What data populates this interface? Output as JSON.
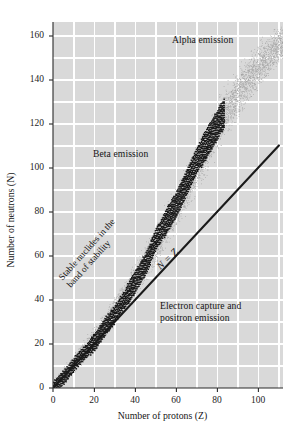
{
  "chart_data": {
    "type": "scatter",
    "title": "",
    "xlabel": "Number of protons (Z)",
    "ylabel": "Number of neutrons (N)",
    "xlim": [
      0,
      112
    ],
    "ylim": [
      0,
      166
    ],
    "xticks": [
      0,
      20,
      40,
      60,
      80,
      100
    ],
    "yticks": [
      0,
      20,
      40,
      60,
      80,
      100,
      120,
      140,
      160
    ],
    "grid": true,
    "grid_minor_step_x": 10,
    "grid_minor_step_y": 10,
    "legend": "none",
    "background_color": "#d9d9d9",
    "grid_color": "#ffffff",
    "series": [
      {
        "name": "Band of stability (stippled)",
        "type": "band",
        "color": "#9a9a9a",
        "description": "Stippled band of known nuclides, widening with Z",
        "x": [
          0,
          10,
          20,
          30,
          40,
          50,
          60,
          70,
          80,
          90,
          100,
          110
        ],
        "y_center": [
          1,
          11,
          22,
          35,
          49,
          65,
          82,
          100,
          119,
          134,
          146,
          156
        ],
        "half_width": [
          2,
          4,
          5,
          6,
          7,
          8,
          9,
          10,
          11,
          11,
          10,
          8
        ]
      },
      {
        "name": "Stable nuclides",
        "type": "staircase",
        "color": "#1a1a1a",
        "x": [
          0,
          5,
          10,
          15,
          20,
          25,
          30,
          35,
          40,
          45,
          50,
          55,
          60,
          65,
          70,
          75,
          80,
          83
        ],
        "y": [
          0,
          5,
          11,
          16,
          21,
          28,
          34,
          41,
          49,
          57,
          68,
          76,
          84,
          94,
          104,
          112,
          120,
          125
        ]
      },
      {
        "name": "N = Z",
        "type": "line",
        "color": "#1a1a1a",
        "x": [
          0,
          110
        ],
        "y": [
          0,
          110
        ]
      }
    ],
    "annotations": [
      {
        "name": "alpha-emission",
        "text": "Alpha emission",
        "x": 70,
        "y": 155
      },
      {
        "name": "beta-emission",
        "text": "Beta emission",
        "x": 25,
        "y": 107
      },
      {
        "name": "electron-capture",
        "line1": "Electron capture and",
        "line2": "positron emission",
        "x": 62,
        "y": 33
      },
      {
        "name": "band-of-stability",
        "line1": "Stable nuclides in the",
        "line2": "band of stability",
        "x": 14,
        "y": 55,
        "rotation": -48
      },
      {
        "name": "n-equals-z",
        "text": "N = Z",
        "x": 52,
        "y": 44,
        "rotation": -44,
        "italic": true
      }
    ]
  },
  "axes": {
    "x": {
      "label": "Number of protons (Z)",
      "ticks": [
        "0",
        "20",
        "40",
        "60",
        "80",
        "100"
      ]
    },
    "y": {
      "label": "Number of neutrons (N)",
      "ticks": [
        "0",
        "20",
        "40",
        "60",
        "80",
        "100",
        "120",
        "140",
        "160"
      ]
    }
  },
  "labels": {
    "alpha_emission": "Alpha emission",
    "beta_emission": "Beta emission",
    "electron_capture_line1": "Electron capture and",
    "electron_capture_line2": "positron emission",
    "band_line1": "Stable nuclides in the",
    "band_line2": "band of stability",
    "n_equals_z": "N = Z"
  },
  "colors": {
    "plot_background": "#d9d9d9",
    "gridline": "#ffffff",
    "stable_band": "#1a1a1a",
    "stipple": "#9a9a9a",
    "page_background": "#ffffff"
  }
}
